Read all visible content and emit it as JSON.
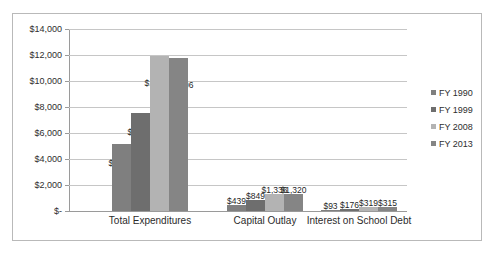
{
  "chart_data": {
    "type": "bar",
    "title": "",
    "subtitle": "",
    "xlabel": "",
    "ylabel": "",
    "categories": [
      "Total Expenditures",
      "Capital Outlay",
      "Interest on School Debt"
    ],
    "series": [
      {
        "name": "FY 1990",
        "color": "#7f7f7f",
        "values": [
          5174,
          439,
          93
        ],
        "labels": [
          "$5,174",
          "$439",
          "$93"
        ]
      },
      {
        "name": "FY 1999",
        "color": "#6e6e6e",
        "values": [
          7533,
          849,
          176
        ],
        "labels": [
          "$7,533",
          "$849",
          "$176"
        ]
      },
      {
        "name": "FY 2008",
        "color": "#b3b3b3",
        "values": [
          11952,
          1336,
          319
        ],
        "labels": [
          "$11,952",
          "$1,336",
          "$319"
        ]
      },
      {
        "name": "FY 2013",
        "color": "#858585",
        "values": [
          11806,
          1320,
          315
        ],
        "labels": [
          "$11,806",
          "$1,320",
          "$315"
        ]
      }
    ],
    "ylim": [
      0,
      14000
    ],
    "ytick_values": [
      0,
      2000,
      4000,
      6000,
      8000,
      10000,
      12000,
      14000
    ],
    "ytick_labels": [
      "$-",
      "$2,000",
      "$4,000",
      "$6,000",
      "$8,000",
      "$10,000",
      "$12,000",
      "$14,000"
    ],
    "grid": true,
    "legend_position": "right",
    "border_color": "#b9b9b9",
    "gridline_color": "#c6c6c6",
    "axis_color": "#9a9a9a"
  },
  "legend": {
    "items": [
      {
        "label": "FY 1990"
      },
      {
        "label": "FY 1999"
      },
      {
        "label": "FY 2008"
      },
      {
        "label": "FY 2013"
      }
    ]
  }
}
